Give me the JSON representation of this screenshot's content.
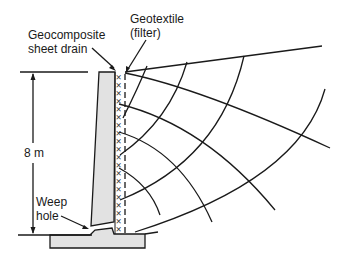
{
  "diagram": {
    "title": "",
    "labels": {
      "geotextile_line1": "Geotextile",
      "geotextile_line2": "(filter)",
      "geocomposite_line1": "Geocomposite",
      "geocomposite_line2": "sheet drain",
      "height": "8 m",
      "weep_line1": "Weep",
      "weep_line2": "hole"
    },
    "components": [
      {
        "name": "retaining-wall-stem",
        "material": "concrete"
      },
      {
        "name": "footing",
        "material": "concrete"
      },
      {
        "name": "geocomposite-sheet-drain",
        "pattern": "crossed X marks"
      },
      {
        "name": "geotextile-filter",
        "pattern": "dashed line"
      },
      {
        "name": "weep-hole",
        "location": "base of stem"
      },
      {
        "name": "flow-net",
        "description": "curvilinear flow lines and equipotential lines in backfill"
      },
      {
        "name": "backfill-surface",
        "description": "sloping ground line"
      }
    ],
    "dimension": {
      "value": "8 m",
      "from": "top of wall",
      "to": "ground level at toe"
    },
    "colors": {
      "line": "#1a1a1a",
      "concrete_fill": "#e2e2e2",
      "background": "#ffffff"
    }
  }
}
